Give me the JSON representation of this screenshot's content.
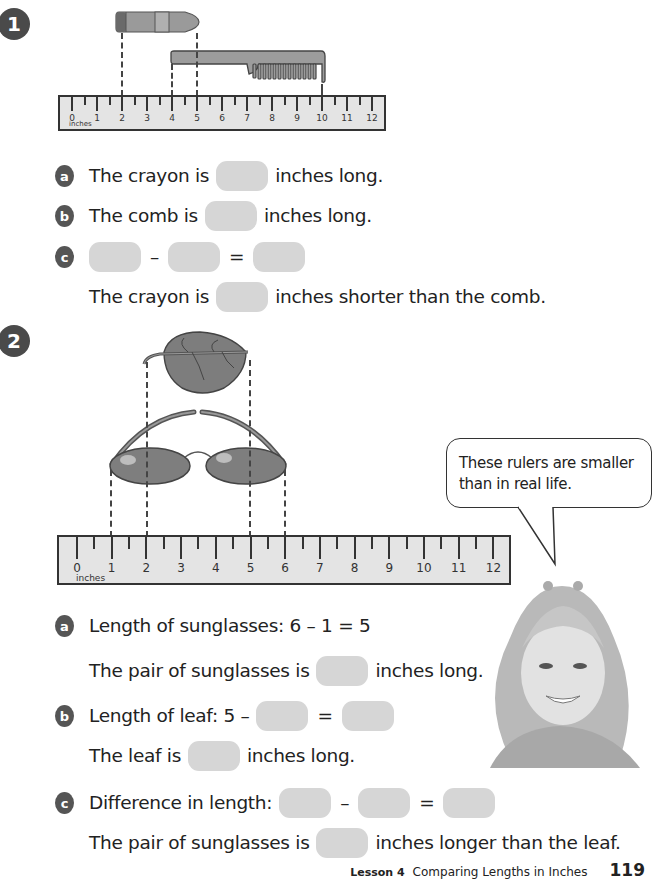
{
  "problem1": {
    "number": "1",
    "ruler": {
      "unit_label": "inches",
      "ticks": [
        "0",
        "1",
        "2",
        "3",
        "4",
        "5",
        "6",
        "7",
        "8",
        "9",
        "10",
        "11",
        "12"
      ]
    },
    "crayon": {
      "start_inch": 2,
      "end_inch": 5
    },
    "comb": {
      "start_inch": 4,
      "end_inch": 10
    },
    "a": {
      "letter": "a",
      "prefix": "The crayon is",
      "suffix": "inches long."
    },
    "b": {
      "letter": "b",
      "prefix": "The comb is",
      "suffix": "inches long."
    },
    "c": {
      "letter": "c",
      "minus": "–",
      "equals": "=",
      "sentence_prefix": "The crayon is",
      "sentence_suffix": "inches shorter than the comb."
    }
  },
  "problem2": {
    "number": "2",
    "ruler": {
      "unit_label": "inches",
      "ticks": [
        "0",
        "1",
        "2",
        "3",
        "4",
        "5",
        "6",
        "7",
        "8",
        "9",
        "10",
        "11",
        "12"
      ]
    },
    "sunglasses": {
      "start_inch": 1,
      "end_inch": 6
    },
    "leaf": {
      "start_inch": 2,
      "end_inch": 5
    },
    "speech_bubble": {
      "line1": "These rulers are smaller",
      "line2": "than in real life."
    },
    "a": {
      "letter": "a",
      "equation": "Length of sunglasses: 6 – 1 = 5",
      "sentence_prefix": "The pair of sunglasses is",
      "sentence_suffix": "inches long."
    },
    "b": {
      "letter": "b",
      "equation_prefix": "Length of leaf: 5 –",
      "equals": "=",
      "sentence_prefix": "The leaf is",
      "sentence_suffix": "inches long."
    },
    "c": {
      "letter": "c",
      "equation_prefix": "Difference in length:",
      "minus": "–",
      "equals": "=",
      "sentence_prefix": "The pair of sunglasses is",
      "sentence_suffix": "inches longer than the leaf."
    }
  },
  "footer": {
    "lesson": "Lesson 4",
    "title": "Comparing Lengths in Inches",
    "page": "119"
  }
}
